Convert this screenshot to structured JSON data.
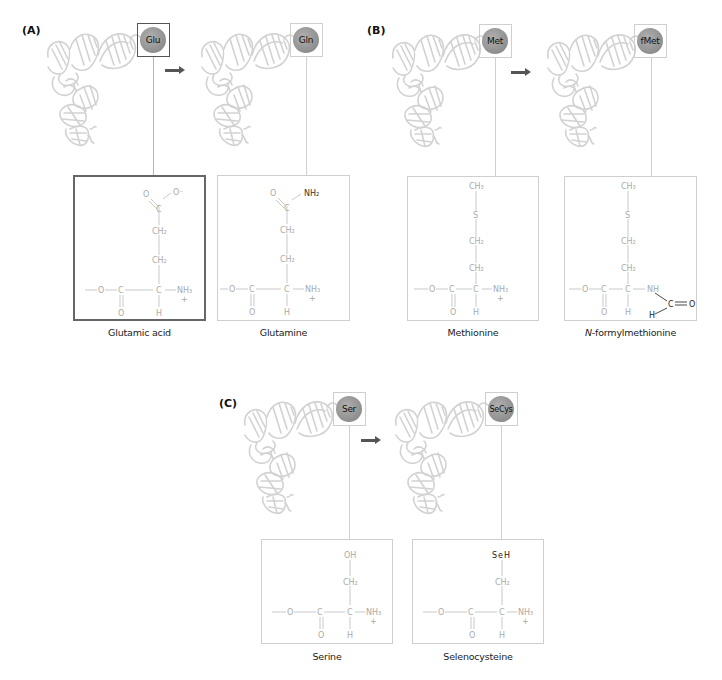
{
  "figure": {
    "panels": [
      {
        "id": "A",
        "label": "(A)",
        "from": {
          "abbrev": "Glu",
          "name": "Glutamic acid",
          "selected": true,
          "side_chain": [
            "O",
            "O⁻",
            "C",
            "CH₂",
            "CH₂"
          ]
        },
        "to": {
          "abbrev": "Gln",
          "name": "Glutamine",
          "selected": false,
          "side_chain": [
            "O",
            "NH₂",
            "C",
            "CH₂",
            "CH₂"
          ]
        }
      },
      {
        "id": "B",
        "label": "(B)",
        "from": {
          "abbrev": "Met",
          "name": "Methionine",
          "selected": false,
          "side_chain": [
            "CH₃",
            "S",
            "CH₂",
            "CH₂"
          ]
        },
        "to": {
          "abbrev": "fMet",
          "name_prefix": "N",
          "name_suffix": "-formylmethionine",
          "name": "N-formylmethionine",
          "selected": false,
          "side_chain": [
            "CH₃",
            "S",
            "CH₂",
            "CH₂"
          ],
          "formyl": [
            "NH",
            "C",
            "O",
            "H"
          ]
        }
      },
      {
        "id": "C",
        "label": "(C)",
        "from": {
          "abbrev": "Ser",
          "name": "Serine",
          "selected": false,
          "side_chain": [
            "OH",
            "CH₂"
          ]
        },
        "to": {
          "abbrev": "SeCys",
          "name": "Selenocysteine",
          "selected": false,
          "side_chain": [
            "SeH",
            "CH₂"
          ]
        }
      }
    ],
    "backbone": {
      "o": "O",
      "c_carbonyl": "C",
      "c_alpha": "C",
      "nh3": "NH₃",
      "plus": "+",
      "carbonyl_o": "O",
      "h": "H"
    },
    "colors": {
      "trna_stroke": "#d2d2d2",
      "aa_ball": "#999999",
      "box_border": "#cfcfcf",
      "selected_border": "#555555",
      "arrow": "#555555",
      "structure_text": "#aaaaaa",
      "highlight_text": "#222222"
    }
  }
}
